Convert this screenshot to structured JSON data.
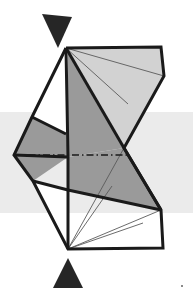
{
  "figure": {
    "title": "Polyhedron with cutting plane",
    "width": 193,
    "height": 296,
    "background_color": "#ffffff"
  },
  "colors": {
    "background": "#ffffff",
    "band_fill": "#ebebeb",
    "face_light": "#d2d2d2",
    "face_medium": "#9a9a9a",
    "face_white": "#ffffff",
    "outline": "#1a1a1a",
    "thin_line": "#5a5a5a",
    "arrow_fill": "#262626"
  },
  "band": {
    "label": "horizontal-cut-band",
    "x": 0,
    "y": 112,
    "width": 193,
    "height": 101,
    "fill": "#ebebeb"
  },
  "vertices": {
    "top_apex": [
      66,
      48
    ],
    "top_right": [
      161,
      47
    ],
    "right_upper": [
      164,
      76
    ],
    "right_mid": [
      124,
      148
    ],
    "right_vertex": [
      161,
      210
    ],
    "bottom_right": [
      163,
      248
    ],
    "bottom_apex": [
      68,
      249
    ],
    "left_lower": [
      33,
      181
    ],
    "left_vertex": [
      14,
      155
    ],
    "left_upper": [
      32,
      117
    ],
    "spine_top": [
      66,
      48
    ],
    "spine_mid": [
      68,
      157
    ],
    "spine_bottom": [
      68,
      249
    ],
    "inner_right": [
      128,
      104
    ],
    "inner_notch": [
      95,
      133
    ]
  },
  "faces": [
    {
      "name": "upper-light-face",
      "shade": "light",
      "points": "66,48 161,47 164,76 124,148"
    },
    {
      "name": "upper-medium-face",
      "shade": "medium",
      "points": "66,48 124,148 68,157 68,48"
    },
    {
      "name": "mid-medium-face",
      "shade": "medium",
      "points": "68,157 124,148 161,210 68,190"
    },
    {
      "name": "left-medium-face",
      "shade": "medium",
      "points": "32,117 66,134 68,157 14,155"
    },
    {
      "name": "left-lower-medium-face",
      "shade": "medium",
      "points": "14,155 68,157 33,181"
    },
    {
      "name": "left-white-face",
      "shade": "white",
      "points": "66,48 32,117 66,134"
    },
    {
      "name": "lower-white-face",
      "shade": "white",
      "points": "33,181 68,190 68,249"
    },
    {
      "name": "bottom-white-face",
      "shade": "white",
      "points": "68,249 161,210 163,248"
    }
  ],
  "edges": [
    {
      "name": "edge-top-apex-to-top-right",
      "from": "top_apex",
      "to": "top_right",
      "weight": "thick"
    },
    {
      "name": "edge-top-right-to-right-upper",
      "from": "top_right",
      "to": "right_upper",
      "weight": "thick"
    },
    {
      "name": "edge-right-upper-to-right-mid",
      "from": "right_upper",
      "to": "right_mid",
      "weight": "thick"
    },
    {
      "name": "edge-right-mid-to-right-vertex",
      "from": "right_mid",
      "to": "right_vertex",
      "weight": "thick"
    },
    {
      "name": "edge-right-vertex-to-bottom-right",
      "from": "right_vertex",
      "to": "bottom_right",
      "weight": "thick"
    },
    {
      "name": "edge-bottom-right-to-bottom-apex",
      "from": "bottom_right",
      "to": "bottom_apex",
      "weight": "thick"
    },
    {
      "name": "edge-bottom-apex-to-left-lower",
      "from": "bottom_apex",
      "to": "left_lower",
      "weight": "thick"
    },
    {
      "name": "edge-left-lower-to-left-vertex",
      "from": "left_lower",
      "to": "left_vertex",
      "weight": "thick"
    },
    {
      "name": "edge-left-vertex-to-left-upper",
      "from": "left_vertex",
      "to": "left_upper",
      "weight": "thick"
    },
    {
      "name": "edge-left-upper-to-top-apex",
      "from": "left_upper",
      "to": "top_apex",
      "weight": "thick"
    },
    {
      "name": "edge-vertical-spine",
      "from": "spine_top",
      "to": "spine_bottom",
      "weight": "thick"
    },
    {
      "name": "edge-apex-to-right-mid",
      "from": "top_apex",
      "to": "right_mid",
      "weight": "thick"
    },
    {
      "name": "edge-right-mid-diagonal",
      "from": "right_mid",
      "to": "right_vertex",
      "weight": "thick"
    }
  ],
  "thin_edges": [
    {
      "name": "thin-apex-to-right-upper",
      "points": "66,48 164,76"
    },
    {
      "name": "thin-apex-to-inner-right",
      "points": "66,48 128,104"
    },
    {
      "name": "thin-right-mid-to-right-vertex-inner",
      "points": "124,148 161,210"
    },
    {
      "name": "thin-bottom-to-right-vertex",
      "points": "68,249 161,210"
    },
    {
      "name": "thin-bottom-to-mid",
      "points": "68,249 124,148"
    },
    {
      "name": "thin-bottom-fan-a",
      "points": "68,249 112,186"
    },
    {
      "name": "thin-bottom-fan-b",
      "points": "68,249 143,223"
    },
    {
      "name": "thin-left-notch",
      "points": "32,117 66,134"
    },
    {
      "name": "thin-left-lower-edge",
      "points": "33,181 68,190"
    }
  ],
  "cut_line": {
    "name": "dash-dot-cut-line",
    "style": "dash-dot",
    "from": [
      14,
      155
    ],
    "to": [
      130,
      155
    ],
    "color": "#1a1a1a"
  },
  "arrows": [
    {
      "name": "top-arrow-down",
      "direction": "down",
      "points": "42,14 72,17 58,48",
      "fill": "#262626"
    },
    {
      "name": "bottom-arrow-up",
      "direction": "up",
      "points": "68,258 83,288 53,288",
      "fill": "#262626"
    }
  ],
  "speck": {
    "name": "corner-speck",
    "x": 181,
    "y": 285,
    "size": 2,
    "fill": "#8a8a8a"
  }
}
